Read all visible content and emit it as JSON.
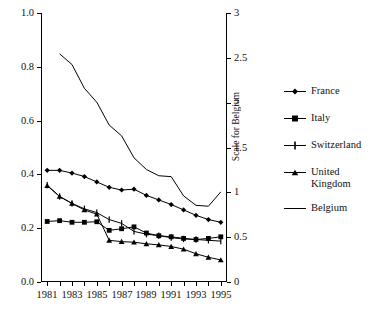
{
  "chart_data": {
    "type": "line",
    "title": "",
    "xlabel": "",
    "ylabel": "",
    "grid": false,
    "legend_position": "right",
    "x": [
      1981,
      1982,
      1983,
      1984,
      1985,
      1986,
      1987,
      1988,
      1989,
      1990,
      1991,
      1992,
      1993,
      1994,
      1995
    ],
    "x_tick_labels": [
      "1981",
      "1983",
      "1985",
      "1987",
      "1989",
      "1991",
      "1993",
      "1995"
    ],
    "x_tick_years": [
      1981,
      1983,
      1985,
      1987,
      1989,
      1991,
      1993,
      1995
    ],
    "xlim": [
      1980.5,
      1995.5
    ],
    "ylim_left": [
      0.0,
      1.0
    ],
    "ylim_right": [
      0,
      3
    ],
    "y_left_ticks": [
      "0.0",
      "0.2",
      "0.4",
      "0.6",
      "0.8",
      "1.0"
    ],
    "y_left_tick_values": [
      0.0,
      0.2,
      0.4,
      0.6,
      0.8,
      1.0
    ],
    "y_right_ticks": [
      "0",
      "0.5",
      "1",
      "1.5",
      "2",
      "2.5",
      "3"
    ],
    "y_right_tick_values": [
      0,
      0.5,
      1,
      1.5,
      2,
      2.5,
      3
    ],
    "right_axis_title": "Scale for Belgium",
    "series": [
      {
        "name": "France",
        "marker": "diamond",
        "axis": "left",
        "values": [
          0.415,
          0.415,
          0.405,
          0.392,
          0.372,
          0.352,
          0.342,
          0.345,
          0.322,
          0.305,
          0.288,
          0.268,
          0.248,
          0.232,
          0.222
        ]
      },
      {
        "name": "Italy",
        "marker": "square",
        "axis": "left",
        "values": [
          0.225,
          0.228,
          0.222,
          0.222,
          0.224,
          0.192,
          0.198,
          0.205,
          0.182,
          0.172,
          0.168,
          0.162,
          0.158,
          0.162,
          0.168
        ]
      },
      {
        "name": "Switzerland",
        "marker": "plus",
        "axis": "left",
        "values": [
          0.36,
          0.318,
          0.292,
          0.272,
          0.258,
          0.232,
          0.218,
          0.188,
          0.178,
          0.172,
          0.165,
          0.16,
          0.158,
          0.155,
          0.152
        ]
      },
      {
        "name": "United Kingdom",
        "marker": "triangle",
        "axis": "left",
        "values": [
          0.358,
          0.318,
          0.292,
          0.268,
          0.252,
          0.155,
          0.15,
          0.148,
          0.142,
          0.138,
          0.132,
          0.122,
          0.105,
          0.092,
          0.082
        ]
      },
      {
        "name": "Belgium",
        "marker": "none",
        "axis": "right",
        "values": [
          null,
          2.545,
          2.425,
          2.16,
          2.005,
          1.75,
          1.63,
          1.385,
          1.255,
          1.185,
          1.175,
          0.96,
          0.855,
          0.845,
          1.005
        ]
      }
    ],
    "legend_entries": [
      {
        "label": "France",
        "marker": "diamond"
      },
      {
        "label": "Italy",
        "marker": "square"
      },
      {
        "label": "Switzerland",
        "marker": "plus"
      },
      {
        "label": "United Kingdom",
        "marker": "triangle"
      },
      {
        "label": "Belgium",
        "marker": "none"
      }
    ],
    "colors": {
      "line": "#000000",
      "axis": "#000000",
      "background": "#ffffff"
    }
  }
}
